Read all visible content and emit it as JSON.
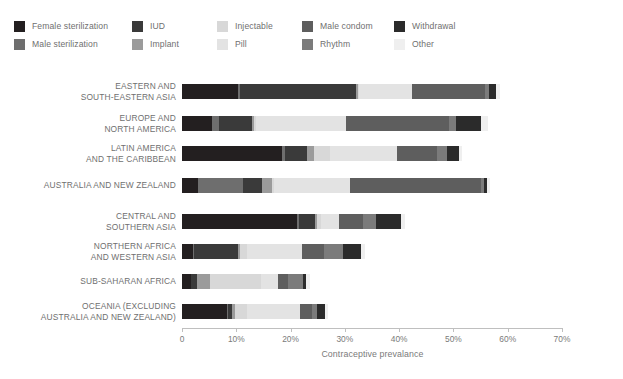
{
  "legend": {
    "items": [
      {
        "label": "Female sterilization",
        "color": "#231f20",
        "swatch_name": "legend-swatch-female-sterilization"
      },
      {
        "label": "Male sterilization",
        "color": "#6e6e6e",
        "swatch_name": "legend-swatch-male-sterilization"
      },
      {
        "label": "IUD",
        "color": "#3a3a3a",
        "swatch_name": "legend-swatch-iud"
      },
      {
        "label": "Implant",
        "color": "#9b9b9b",
        "swatch_name": "legend-swatch-implant"
      },
      {
        "label": "Injectable",
        "color": "#d8d8d8",
        "swatch_name": "legend-swatch-injectable"
      },
      {
        "label": "Pill",
        "color": "#e3e3e3",
        "swatch_name": "legend-swatch-pill"
      },
      {
        "label": "Male condom",
        "color": "#5e5e5e",
        "swatch_name": "legend-swatch-male-condom"
      },
      {
        "label": "Rhythm",
        "color": "#7b7b7b",
        "swatch_name": "legend-swatch-rhythm"
      },
      {
        "label": "Withdrawal",
        "color": "#2b2b2b",
        "swatch_name": "legend-swatch-withdrawal"
      },
      {
        "label": "Other",
        "color": "#efefef",
        "swatch_name": "legend-swatch-other"
      }
    ]
  },
  "axis": {
    "x_title": "Contraceptive prevalance",
    "x_ticks": [
      "0",
      "10%",
      "20%",
      "30%",
      "40%",
      "50%",
      "60%",
      "70%"
    ],
    "x_tick_values": [
      0,
      10,
      20,
      30,
      40,
      50,
      60,
      70
    ]
  },
  "chart_data": {
    "type": "bar",
    "orientation": "horizontal",
    "stacked": true,
    "title": "",
    "xlabel": "Contraceptive prevalance",
    "ylabel": "",
    "xlim": [
      0,
      70
    ],
    "grid": false,
    "legend_position": "top",
    "tick_suffix": "%",
    "series": [
      {
        "name": "Female sterilization",
        "color": "#231f20",
        "values": [
          10.3,
          5.6,
          18.5,
          2.9,
          21.2,
          2.0,
          1.6,
          8.2
        ]
      },
      {
        "name": "Male sterilization",
        "color": "#6e6e6e",
        "values": [
          0.3,
          1.3,
          0.5,
          8.4,
          0.3,
          0.2,
          0.1,
          0.3
        ]
      },
      {
        "name": "IUD",
        "color": "#3a3a3a",
        "values": [
          21.5,
          6.0,
          4.0,
          3.5,
          3.0,
          8.2,
          1.1,
          0.7
        ]
      },
      {
        "name": "Implant",
        "color": "#9b9b9b",
        "values": [
          0.3,
          0.4,
          1.4,
          1.8,
          0.4,
          0.3,
          2.4,
          0.5
        ]
      },
      {
        "name": "Injectable",
        "color": "#d8d8d8",
        "values": [
          0.3,
          0.4,
          2.9,
          0.4,
          0.7,
          1.3,
          9.4,
          2.2
        ]
      },
      {
        "name": "Pill",
        "color": "#e3e3e3",
        "values": [
          9.6,
          16.6,
          12.4,
          14.0,
          3.4,
          10.2,
          3.1,
          9.8
        ]
      },
      {
        "name": "Male condom",
        "color": "#5e5e5e",
        "values": [
          13.6,
          18.9,
          7.3,
          24.1,
          4.3,
          4.0,
          1.9,
          2.2
        ]
      },
      {
        "name": "Rhythm",
        "color": "#7b7b7b",
        "values": [
          0.6,
          1.2,
          1.8,
          0.6,
          2.5,
          3.5,
          2.7,
          1.0
        ]
      },
      {
        "name": "Withdrawal",
        "color": "#2b2b2b",
        "values": [
          1.4,
          4.7,
          2.2,
          0.5,
          4.6,
          3.2,
          0.6,
          1.4
        ]
      },
      {
        "name": "Other",
        "color": "#efefef",
        "values": [
          0.7,
          1.2,
          0.5,
          0.6,
          0.6,
          0.8,
          0.6,
          0.6
        ]
      }
    ],
    "categories": [
      {
        "lines": [
          "EASTERN AND",
          "SOUTH-EASTERN ASIA"
        ]
      },
      {
        "lines": [
          "EUROPE AND",
          "NORTH AMERICA"
        ]
      },
      {
        "lines": [
          "LATIN AMERICA",
          "AND THE CARIBBEAN"
        ]
      },
      {
        "lines": [
          "AUSTRALIA AND NEW ZEALAND"
        ]
      },
      {
        "lines": [
          "CENTRAL AND",
          "SOUTHERN ASIA"
        ]
      },
      {
        "lines": [
          "NORTHERN AFRICA",
          "AND WESTERN ASIA"
        ]
      },
      {
        "lines": [
          "SUB-SAHARAN AFRICA"
        ]
      },
      {
        "lines": [
          "OCEANIA (EXCLUDING",
          "AUSTRALIA AND NEW ZEALAND)"
        ]
      }
    ]
  }
}
